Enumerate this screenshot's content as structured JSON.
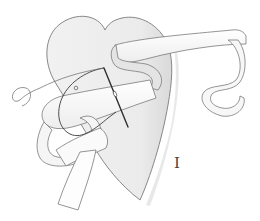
{
  "figure": {
    "step_label": "I",
    "colors": {
      "background": "#ffffff",
      "heart_fill": "#ececec",
      "heart_shadow": "#d6d6d6",
      "ribbon_fill": "#fbfbfb",
      "ribbon_shadow": "#e2e2e2",
      "outline": "#7a7a7a",
      "needle": "#2f2f2f",
      "thread": "#3a3a3a"
    }
  }
}
